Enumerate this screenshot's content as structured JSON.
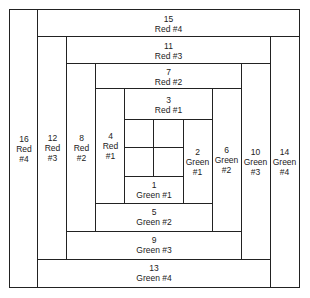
{
  "diagram": {
    "title": "",
    "blocks": [
      {
        "n": "1",
        "color": "Green",
        "tier": "#1"
      },
      {
        "n": "2",
        "color": "Green",
        "tier": "#1"
      },
      {
        "n": "3",
        "color": "Red",
        "tier": "#1"
      },
      {
        "n": "4",
        "color": "Red",
        "tier": "#1"
      },
      {
        "n": "5",
        "color": "Green",
        "tier": "#2"
      },
      {
        "n": "6",
        "color": "Green",
        "tier": "#2"
      },
      {
        "n": "7",
        "color": "Red",
        "tier": "#2"
      },
      {
        "n": "8",
        "color": "Red",
        "tier": "#2"
      },
      {
        "n": "9",
        "color": "Green",
        "tier": "#3"
      },
      {
        "n": "10",
        "color": "Green",
        "tier": "#3"
      },
      {
        "n": "11",
        "color": "Red",
        "tier": "#3"
      },
      {
        "n": "12",
        "color": "Red",
        "tier": "#3"
      },
      {
        "n": "13",
        "color": "Green",
        "tier": "#4"
      },
      {
        "n": "14",
        "color": "Green",
        "tier": "#4"
      },
      {
        "n": "15",
        "color": "Red",
        "tier": "#4"
      },
      {
        "n": "16",
        "color": "Red",
        "tier": "#4"
      }
    ],
    "line_color": "#222222",
    "fill_color": "#ffffff"
  }
}
